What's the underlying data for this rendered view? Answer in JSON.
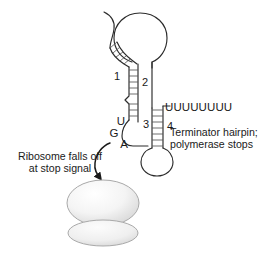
{
  "figure": {
    "background_color": "#ffffff",
    "stroke_color": "#2b2b2b"
  },
  "segments": [
    {
      "id": "segment-1",
      "label": "1"
    },
    {
      "id": "segment-2",
      "label": "2"
    },
    {
      "id": "segment-3",
      "label": "3"
    },
    {
      "id": "segment-4",
      "label": "4"
    }
  ],
  "stop_codon": {
    "name": "UGA stop codon",
    "letters": [
      {
        "id": "codon-u",
        "label": "U"
      },
      {
        "id": "codon-g",
        "label": "G"
      },
      {
        "id": "codon-a",
        "label": "A"
      }
    ]
  },
  "poly_u_tail": {
    "label": "UUUUUUUU",
    "count": 8
  },
  "annotations": {
    "terminator": {
      "line1": "Terminator hairpin;",
      "line2": "polymerase stops"
    },
    "ribosome": {
      "line1": "Ribosome falls off",
      "line2": "at stop signal"
    }
  },
  "ribosome": {
    "large_subunit": "large-subunit",
    "small_subunit": "small-subunit",
    "fill_light": "#fbfbfb",
    "fill_shade": "#d8d8d8",
    "edge_color": "#a9a9a9"
  },
  "colors": {
    "ink": "#1a1a1a",
    "rung": "#555555",
    "paper": "#ffffff"
  }
}
